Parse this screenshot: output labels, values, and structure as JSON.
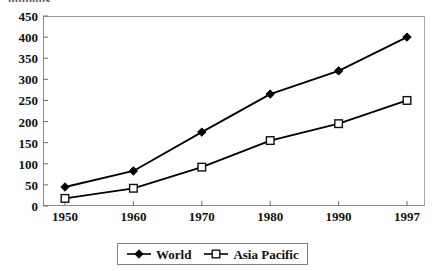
{
  "axis_title": "millions",
  "legend": {
    "position": "bottom",
    "entries": [
      {
        "label": "World",
        "marker": "filled-diamond"
      },
      {
        "label": "Asia Pacific",
        "marker": "open-square"
      }
    ]
  },
  "chart_data": {
    "type": "line",
    "title": "millions",
    "xlabel": "",
    "ylabel": "millions",
    "grid": false,
    "legend_position": "bottom",
    "categories": [
      "1950",
      "1960",
      "1970",
      "1980",
      "1990",
      "1997"
    ],
    "x_tick_labels": [
      "1950",
      "1960",
      "1970",
      "1980",
      "1990",
      "1997"
    ],
    "y_tick_labels": [
      "0",
      "50",
      "100",
      "150",
      "200",
      "250",
      "300",
      "350",
      "400",
      "450"
    ],
    "ylim": [
      0,
      450
    ],
    "ytick_step": 50,
    "series": [
      {
        "name": "World",
        "marker": "filled-diamond",
        "color": "#000000",
        "values": [
          45,
          83,
          175,
          265,
          320,
          400
        ]
      },
      {
        "name": "Asia Pacific",
        "marker": "open-square",
        "color": "#000000",
        "values": [
          18,
          42,
          92,
          155,
          195,
          250
        ]
      }
    ]
  }
}
